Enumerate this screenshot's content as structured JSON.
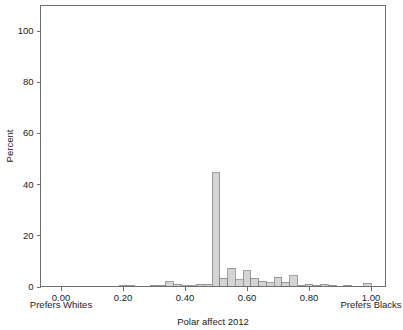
{
  "figure": {
    "background_color": "#ffffff",
    "frame_color": "#6f6f6f",
    "bar_fill_color": "#d4d4d2",
    "bar_edge_color": "#7d7d7d",
    "text_color": "#222222"
  },
  "labels": {
    "xlabel": "Polar affect 2012",
    "ylabel": "Percent",
    "left_anchor": "Prefers Whites",
    "right_anchor": "Prefers Blacks"
  },
  "chart_data": {
    "type": "bar",
    "title": "",
    "subtitle": "",
    "xlabel": "Polar affect 2012",
    "ylabel": "Percent",
    "xlim": [
      -0.02,
      1.02
    ],
    "ylim": [
      0,
      110
    ],
    "grid": false,
    "legend": null,
    "bin_width": 0.025,
    "xticks": [
      0.0,
      0.2,
      0.4,
      0.6,
      0.8,
      1.0
    ],
    "xtick_labels": [
      "0.00",
      "0.20",
      "0.40",
      "0.60",
      "0.80",
      "1.00"
    ],
    "yticks": [
      0,
      20,
      40,
      60,
      80,
      100
    ],
    "ytick_labels": [
      "0",
      "20",
      "40",
      "60",
      "80",
      "100"
    ],
    "annotations": [
      {
        "text": "Prefers Whites",
        "position": "below-axis-left"
      },
      {
        "text": "Prefers Blacks",
        "position": "below-axis-right"
      }
    ],
    "bins": [
      {
        "x0": 0.1875,
        "x1": 0.2125,
        "value": 0.5
      },
      {
        "x0": 0.2125,
        "x1": 0.2375,
        "value": 0.5
      },
      {
        "x0": 0.2875,
        "x1": 0.3125,
        "value": 0.4
      },
      {
        "x0": 0.3125,
        "x1": 0.3375,
        "value": 0.5
      },
      {
        "x0": 0.3375,
        "x1": 0.3625,
        "value": 1.8
      },
      {
        "x0": 0.3625,
        "x1": 0.3875,
        "value": 0.9
      },
      {
        "x0": 0.3875,
        "x1": 0.4125,
        "value": 0.3
      },
      {
        "x0": 0.4125,
        "x1": 0.4375,
        "value": 0.3
      },
      {
        "x0": 0.4375,
        "x1": 0.4625,
        "value": 0.9
      },
      {
        "x0": 0.4625,
        "x1": 0.4875,
        "value": 0.9
      },
      {
        "x0": 0.4875,
        "x1": 0.5125,
        "value": 44.5
      },
      {
        "x0": 0.5125,
        "x1": 0.5375,
        "value": 3.2
      },
      {
        "x0": 0.5375,
        "x1": 0.5625,
        "value": 7.2
      },
      {
        "x0": 0.5625,
        "x1": 0.5875,
        "value": 2.6
      },
      {
        "x0": 0.5875,
        "x1": 0.6125,
        "value": 6.2
      },
      {
        "x0": 0.6125,
        "x1": 0.6375,
        "value": 3.3
      },
      {
        "x0": 0.6375,
        "x1": 0.6625,
        "value": 2.0
      },
      {
        "x0": 0.6625,
        "x1": 0.6875,
        "value": 1.4
      },
      {
        "x0": 0.6875,
        "x1": 0.7125,
        "value": 3.6
      },
      {
        "x0": 0.7125,
        "x1": 0.7375,
        "value": 1.7
      },
      {
        "x0": 0.7375,
        "x1": 0.7625,
        "value": 4.2
      },
      {
        "x0": 0.7625,
        "x1": 0.7875,
        "value": 0.4
      },
      {
        "x0": 0.7875,
        "x1": 0.8125,
        "value": 0.8
      },
      {
        "x0": 0.8125,
        "x1": 0.8375,
        "value": 0.4
      },
      {
        "x0": 0.8375,
        "x1": 0.8625,
        "value": 0.8
      },
      {
        "x0": 0.8625,
        "x1": 0.8875,
        "value": 0.4
      },
      {
        "x0": 0.9125,
        "x1": 0.9375,
        "value": 0.4
      },
      {
        "x0": 0.975,
        "x1": 1.0,
        "value": 1.3
      }
    ]
  }
}
